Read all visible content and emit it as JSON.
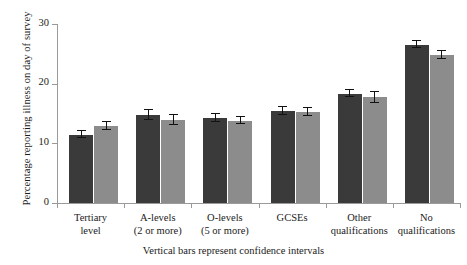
{
  "chart_data": {
    "type": "bar",
    "title": "",
    "subtitle": "",
    "xlabel": "Vertical bars represent confidence intervals",
    "ylabel": "Percentage reporting illness on day of survey",
    "ylim": [
      0,
      30
    ],
    "yticks": [
      0,
      10,
      20,
      30
    ],
    "ytick_labels": [
      "0",
      "10",
      "20",
      "30"
    ],
    "grid": false,
    "legend": "none",
    "categories": [
      "Tertiary level",
      "A-levels (2 or more)",
      "O-levels (5 or more)",
      "GCSEs",
      "Other qualifications",
      "No qualifications"
    ],
    "category_lines": [
      [
        "Tertiary",
        "level"
      ],
      [
        "A-levels",
        "(2 or more)"
      ],
      [
        "O-levels",
        "(5 or more)"
      ],
      [
        "GCSEs",
        ""
      ],
      [
        "Other",
        "qualifications"
      ],
      [
        "No",
        "qualifications"
      ]
    ],
    "series": [
      {
        "name": "series-1",
        "color": "#3a3a3a",
        "values": [
          11.4,
          14.7,
          14.2,
          15.4,
          18.3,
          26.5
        ],
        "ci_low": [
          10.9,
          13.9,
          13.6,
          14.8,
          17.7,
          25.9
        ],
        "ci_high": [
          12.0,
          15.6,
          14.9,
          16.1,
          19.0,
          27.1
        ]
      },
      {
        "name": "series-2",
        "color": "#8c8c8c",
        "values": [
          12.9,
          13.9,
          13.8,
          15.3,
          17.7,
          24.8
        ],
        "ci_low": [
          12.3,
          13.0,
          13.2,
          14.6,
          16.8,
          24.2
        ],
        "ci_high": [
          13.5,
          14.7,
          14.4,
          16.0,
          18.6,
          25.4
        ]
      }
    ]
  },
  "caption": "Vertical bars represent confidence intervals",
  "axis": {
    "y_title": "Percentage reporting illness on day of survey"
  }
}
